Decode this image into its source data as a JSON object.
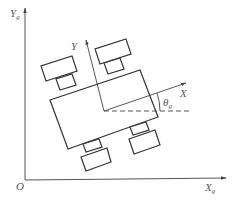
{
  "diagram": {
    "colors": {
      "line": "#444444",
      "text": "#555555",
      "background": "#ffffff"
    },
    "global_frame": {
      "origin_label": "O",
      "x_axis": {
        "label": "X",
        "subscript": "g"
      },
      "y_axis": {
        "label": "Y",
        "subscript": "g"
      }
    },
    "robot_frame": {
      "x_axis": {
        "label": "X"
      },
      "y_axis": {
        "label": "Y"
      }
    },
    "angle": {
      "label": "θ",
      "subscript": "g"
    },
    "robot": {
      "body": "rectangle",
      "wheels": 4
    }
  }
}
